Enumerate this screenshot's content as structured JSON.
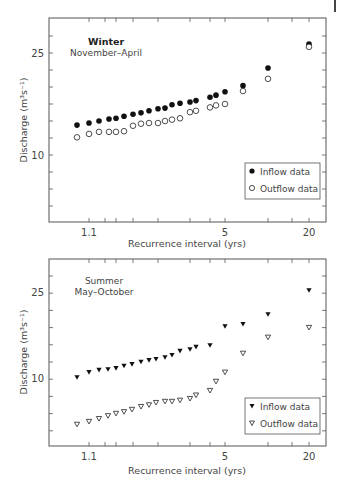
{
  "chart_data": [
    {
      "type": "scatter",
      "title": "Winter",
      "subtitle": "November–April",
      "xlabel": "Recurrence interval (yrs)",
      "ylabel": "Discharge (m³s⁻¹)",
      "x_scale": "probability/log",
      "xticks": [
        "1.1",
        "5",
        "20"
      ],
      "yticks": [
        "10",
        "25"
      ],
      "ylim": [
        0,
        30
      ],
      "grid": false,
      "legend_position": "lower right",
      "marker_style": "circle",
      "x": [
        1.07,
        1.1,
        1.13,
        1.16,
        1.19,
        1.23,
        1.28,
        1.33,
        1.4,
        1.5,
        1.6,
        1.75,
        1.95,
        2.2,
        2.5,
        3.3,
        4.0,
        5.0,
        7.0,
        10.0,
        20.0
      ],
      "series": [
        {
          "name": "Inflow data",
          "marker": "filled-circle",
          "values": [
            14.4,
            14.7,
            15.0,
            15.3,
            15.4,
            15.7,
            16.0,
            16.2,
            16.5,
            16.8,
            16.9,
            17.4,
            17.6,
            17.8,
            18.0,
            18.5,
            18.8,
            19.3,
            20.2,
            22.8,
            26.3
          ]
        },
        {
          "name": "Outflow data",
          "marker": "open-circle",
          "values": [
            12.6,
            13.1,
            13.4,
            13.4,
            13.4,
            13.5,
            14.3,
            14.6,
            14.7,
            14.7,
            15.0,
            15.2,
            15.4,
            16.3,
            16.5,
            17.0,
            17.3,
            17.5,
            19.4,
            21.2,
            25.9
          ]
        }
      ]
    },
    {
      "type": "scatter",
      "title": "Summer",
      "subtitle": "May–October",
      "xlabel": "Recurrence interval (yrs)",
      "ylabel": "Discharge (m³s⁻¹)",
      "x_scale": "probability/log",
      "xticks": [
        "1.1",
        "5",
        "20"
      ],
      "yticks": [
        "10",
        "25"
      ],
      "ylim": [
        1,
        30
      ],
      "grid": false,
      "legend_position": "lower right",
      "marker_style": "triangle-down",
      "x": [
        1.07,
        1.1,
        1.13,
        1.16,
        1.19,
        1.23,
        1.28,
        1.33,
        1.4,
        1.5,
        1.6,
        1.75,
        1.95,
        2.2,
        2.5,
        3.3,
        5.0,
        7.0,
        10.0,
        20.0
      ],
      "series": [
        {
          "name": "Inflow data",
          "marker": "filled-triangle-down",
          "values": [
            10.3,
            11.2,
            11.6,
            11.7,
            11.9,
            12.3,
            12.6,
            13.0,
            13.3,
            13.5,
            13.8,
            14.2,
            14.9,
            15.2,
            15.6,
            15.9,
            19.2,
            19.6,
            21.3,
            25.5
          ]
        },
        {
          "name": "Outflow data",
          "marker": "open-triangle-down",
          "values": [
            2.1,
            2.6,
            3.1,
            3.6,
            4.0,
            4.3,
            4.7,
            5.2,
            5.5,
            5.9,
            6.1,
            6.1,
            6.3,
            6.6,
            7.2,
            8.0,
            9.6,
            11.2,
            14.5,
            17.3,
            19.0
          ]
        }
      ]
    }
  ],
  "panels": [
    {
      "title": "Winter",
      "subtitle": "November–April",
      "ylabel": "Discharge (m³s⁻¹)",
      "xlabel": "Recurrence interval (yrs)",
      "ytick_labels": {
        "top": "25",
        "bottom": "10"
      },
      "xtick_labels": {
        "a": "1.1",
        "b": "5",
        "c": "20"
      },
      "legend": {
        "inflow": "Inflow data",
        "outflow": "Outflow data"
      }
    },
    {
      "title": "Summer",
      "subtitle": "May–October",
      "ylabel": "Discharge (m³s⁻¹)",
      "xlabel": "Recurrence interval (yrs)",
      "ytick_labels": {
        "top": "25",
        "bottom": "10"
      },
      "xtick_labels": {
        "a": "1.1",
        "b": "5",
        "c": "20"
      },
      "legend": {
        "inflow": "Inflow data",
        "outflow": "Outflow data"
      }
    }
  ],
  "colors": {
    "axis": "#555555",
    "marker": "#111111",
    "text": "#444444"
  }
}
